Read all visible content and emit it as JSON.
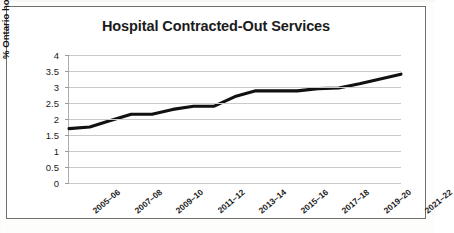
{
  "chart_data": {
    "type": "line",
    "title": "Hospital Contracted-Out Services",
    "xlabel": "",
    "ylabel": "% Ontario hospital spending",
    "ylim": [
      0,
      4
    ],
    "ytick_labels": [
      "4",
      "3.5",
      "3",
      "2.5",
      "2",
      "1.5",
      "1",
      "0.5",
      "0"
    ],
    "ytick_values": [
      4,
      3.5,
      3,
      2.5,
      2,
      1.5,
      1,
      0.5,
      0
    ],
    "grid": true,
    "legend": null,
    "line_color": "#111111",
    "x_tick_labels": [
      "2005–06",
      "2007–08",
      "2009–10",
      "2011–12",
      "2013–14",
      "2015–16",
      "2017–18",
      "2019–20",
      "2021–22"
    ],
    "x": [
      "2005–06",
      "2006–07",
      "2007–08",
      "2008–09",
      "2009–10",
      "2010–11",
      "2011–12",
      "2012–13",
      "2013–14",
      "2014–15",
      "2015–16",
      "2016–17",
      "2017–18",
      "2018–19",
      "2019–20",
      "2020–21",
      "2021–22"
    ],
    "series": [
      {
        "name": "% Ontario hospital spending",
        "values": [
          1.7,
          1.75,
          1.95,
          2.15,
          2.15,
          2.3,
          2.4,
          2.4,
          2.7,
          2.88,
          2.88,
          2.88,
          2.95,
          2.97,
          3.1,
          3.25,
          3.4
        ]
      }
    ]
  },
  "colors": {
    "frame_border": "#6f6f6f",
    "gridline": "#c9c9c9",
    "text": "#1b1b1b",
    "line": "#111111",
    "plot_background": "#ffffff"
  }
}
